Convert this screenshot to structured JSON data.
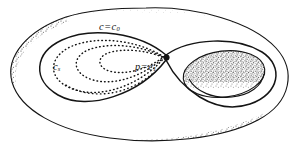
{
  "figure": {
    "type": "line-drawing",
    "background_color": "#ffffff",
    "ink_color": "#141414",
    "width": 304,
    "height": 154,
    "labels": [
      {
        "id": "c0",
        "name": "level-curve-c0-label",
        "base": "c",
        "operator": "=",
        "value": "c",
        "subscript": "0",
        "text": "c = c₀",
        "x": 99,
        "y": 22,
        "describes": "figure-eight level curve through the saddle"
      },
      {
        "id": "cs",
        "name": "level-curve-cs-label",
        "base": "c",
        "operator": "",
        "value": "",
        "subscript": "s",
        "text": "cₛ",
        "x": 53,
        "y": 62,
        "describes": "nested dotted level curves inside the left lobe"
      },
      {
        "id": "p-c1",
        "name": "critical-point-label",
        "base": "p",
        "operator": "=",
        "value": "c",
        "subscript": "1",
        "text": "p = c₁",
        "x": 135,
        "y": 62,
        "describes": "saddle point where the figure-eight self-intersects"
      }
    ],
    "elements": {
      "torus_outer_boundary": "outer silhouette of the torus",
      "torus_inner_hole": "central elliptical hole",
      "figure_eight_curve": "solid self-intersecting level curve c = c0",
      "dotted_level_curves": "nested dashed closed curves c_s",
      "saddle_node": "filled dot at the self-intersection p",
      "stipple_shading": "engraved stipple shading on lower-left rim and inner hole wall"
    }
  }
}
